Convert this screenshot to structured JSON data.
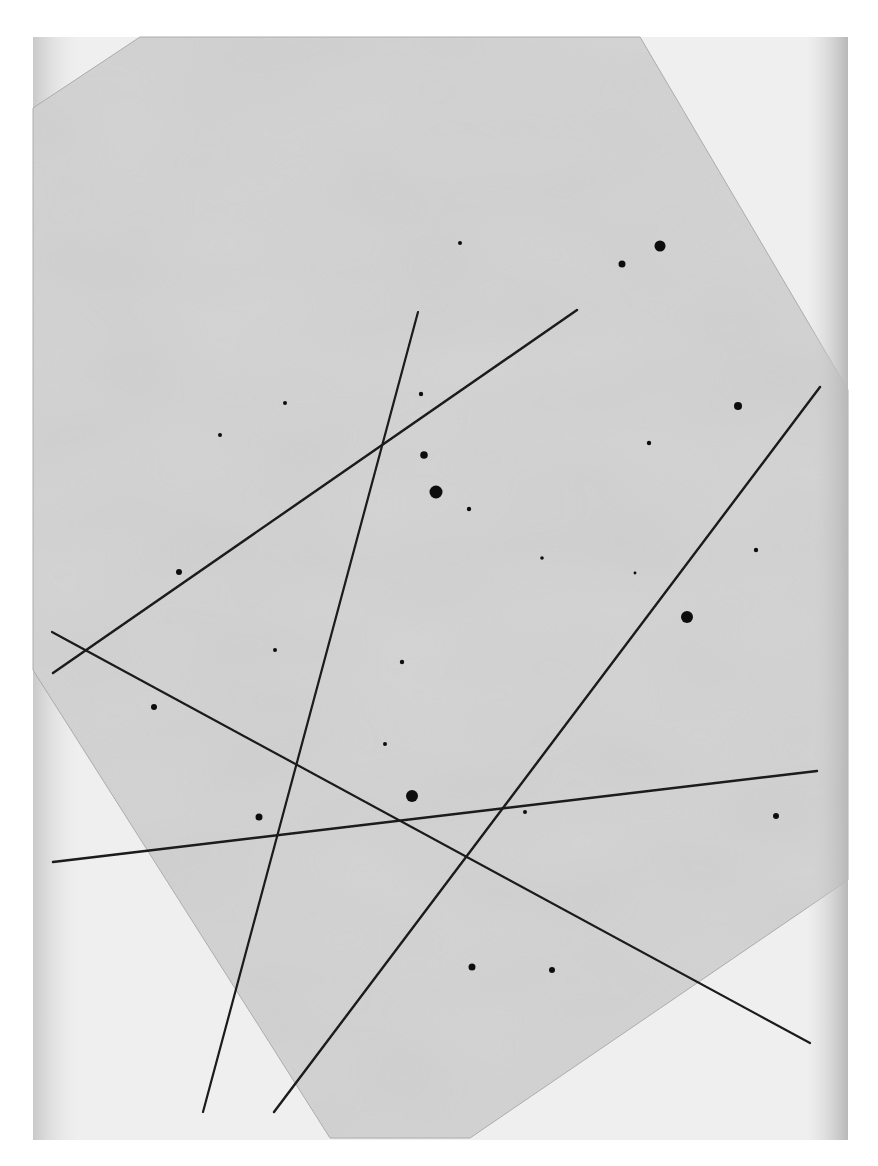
{
  "image": {
    "width": 878,
    "height": 1166,
    "description": "Photographic plate showing star images and five long straight trails",
    "colors": {
      "page_background": "#ffffff",
      "scan_area": "#efefef",
      "scan_area_left_shadow": "#d8d8d8",
      "plate": "#d6d6d6",
      "plate_light_patch": "#e3e3e3",
      "plate_dark_patch": "#c8c8c8",
      "trail": "#1a1a1a",
      "star": "#111111",
      "plate_edge": "#9a9a9a"
    }
  },
  "scan_area": {
    "x": 33,
    "y": 37,
    "w": 815,
    "h": 1103
  },
  "plate_polygon": [
    [
      33,
      108
    ],
    [
      140,
      37
    ],
    [
      640,
      37
    ],
    [
      848,
      390
    ],
    [
      848,
      880
    ],
    [
      470,
      1138
    ],
    [
      330,
      1138
    ],
    [
      33,
      670
    ]
  ],
  "trails": [
    {
      "id": "trail-1",
      "x1": 53,
      "y1": 673,
      "x2": 577,
      "y2": 310,
      "width": 2.4
    },
    {
      "id": "trail-2",
      "x1": 418,
      "y1": 312,
      "x2": 203,
      "y2": 1112,
      "width": 2.2
    },
    {
      "id": "trail-3",
      "x1": 52,
      "y1": 632,
      "x2": 810,
      "y2": 1043,
      "width": 2.2
    },
    {
      "id": "trail-4",
      "x1": 820,
      "y1": 387,
      "x2": 274,
      "y2": 1112,
      "width": 2.4
    },
    {
      "id": "trail-5",
      "x1": 53,
      "y1": 862,
      "x2": 817,
      "y2": 771,
      "width": 2.4
    }
  ],
  "stars": [
    {
      "x": 660,
      "y": 246,
      "r": 5.5
    },
    {
      "x": 622,
      "y": 264,
      "r": 3.5
    },
    {
      "x": 460,
      "y": 243,
      "r": 2.0
    },
    {
      "x": 738,
      "y": 406,
      "r": 4.0
    },
    {
      "x": 649,
      "y": 443,
      "r": 2.2
    },
    {
      "x": 285,
      "y": 403,
      "r": 2.0
    },
    {
      "x": 421,
      "y": 394,
      "r": 2.2
    },
    {
      "x": 220,
      "y": 435,
      "r": 2.0
    },
    {
      "x": 424,
      "y": 455,
      "r": 3.8
    },
    {
      "x": 436,
      "y": 492,
      "r": 6.5
    },
    {
      "x": 469,
      "y": 509,
      "r": 2.2
    },
    {
      "x": 542,
      "y": 558,
      "r": 1.8
    },
    {
      "x": 756,
      "y": 550,
      "r": 2.2
    },
    {
      "x": 635,
      "y": 573,
      "r": 1.4
    },
    {
      "x": 687,
      "y": 617,
      "r": 6.0
    },
    {
      "x": 179,
      "y": 572,
      "r": 3.0
    },
    {
      "x": 275,
      "y": 650,
      "r": 2.0
    },
    {
      "x": 402,
      "y": 662,
      "r": 2.2
    },
    {
      "x": 154,
      "y": 707,
      "r": 3.0
    },
    {
      "x": 385,
      "y": 744,
      "r": 2.0
    },
    {
      "x": 412,
      "y": 796,
      "r": 6.0
    },
    {
      "x": 259,
      "y": 817,
      "r": 3.5
    },
    {
      "x": 525,
      "y": 812,
      "r": 2.0
    },
    {
      "x": 776,
      "y": 816,
      "r": 3.0
    },
    {
      "x": 472,
      "y": 967,
      "r": 3.5
    },
    {
      "x": 552,
      "y": 970,
      "r": 3.0
    }
  ]
}
